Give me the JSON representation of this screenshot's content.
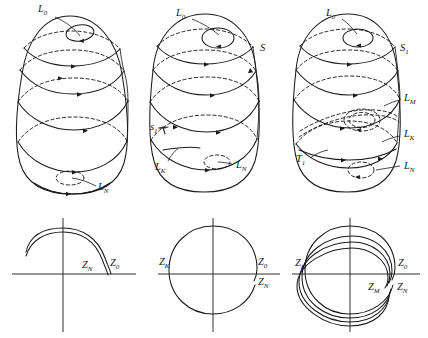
{
  "figure": {
    "caption": "",
    "panel_count": 6,
    "row_top_label": "surface diagrams",
    "row_bottom_label": "phase plane diagrams"
  },
  "panels": [
    {
      "id": "top-left",
      "kind": "surface",
      "labels": [
        {
          "name": "L-zero",
          "base": "L",
          "sub": "0",
          "x": 38,
          "y": 12
        },
        {
          "name": "L-N",
          "base": "L",
          "sub": "N",
          "x": 98,
          "y": 190
        }
      ]
    },
    {
      "id": "top-middle",
      "kind": "surface",
      "labels": [
        {
          "name": "L-zero",
          "base": "L",
          "sub": "0",
          "x": 176,
          "y": 16
        },
        {
          "name": "S",
          "base": "S",
          "sub": "",
          "x": 260,
          "y": 51
        },
        {
          "name": "s-one",
          "base": "s",
          "sub": "1",
          "x": 152,
          "y": 130
        },
        {
          "name": "L-K",
          "base": "L",
          "sub": "K",
          "x": 157,
          "y": 168
        },
        {
          "name": "L-N",
          "base": "L",
          "sub": "N",
          "x": 236,
          "y": 167
        }
      ]
    },
    {
      "id": "top-right",
      "kind": "surface",
      "labels": [
        {
          "name": "L-zero",
          "base": "L",
          "sub": "0",
          "x": 326,
          "y": 16
        },
        {
          "name": "S-one",
          "base": "S",
          "sub": "1",
          "x": 400,
          "y": 51
        },
        {
          "name": "L-M",
          "base": "L",
          "sub": "M",
          "x": 404,
          "y": 101
        },
        {
          "name": "L-K",
          "base": "L",
          "sub": "K",
          "x": 404,
          "y": 137
        },
        {
          "name": "T-one",
          "base": "T",
          "sub": "1",
          "x": 298,
          "y": 161
        },
        {
          "name": "L-N",
          "base": "L",
          "sub": "N",
          "x": 404,
          "y": 168
        }
      ]
    },
    {
      "id": "bottom-left",
      "kind": "phase",
      "curve": "open-arc",
      "labels": [
        {
          "name": "Z-N",
          "base": "Z",
          "sub": "N",
          "x": 82,
          "y": 268
        },
        {
          "name": "Z-zero",
          "base": "Z",
          "sub": "0",
          "x": 110,
          "y": 266
        }
      ]
    },
    {
      "id": "bottom-middle",
      "kind": "phase",
      "curve": "near-closed-circle",
      "labels": [
        {
          "name": "Z-K",
          "base": "Z",
          "sub": "K",
          "x": 160,
          "y": 264
        },
        {
          "name": "Z-zero",
          "base": "Z",
          "sub": "0",
          "x": 258,
          "y": 264
        },
        {
          "name": "Z-N",
          "base": "Z",
          "sub": "N",
          "x": 259,
          "y": 284
        }
      ]
    },
    {
      "id": "bottom-right",
      "kind": "phase",
      "curve": "multi-spiral",
      "labels": [
        {
          "name": "Z-K",
          "base": "Z",
          "sub": "K",
          "x": 296,
          "y": 265
        },
        {
          "name": "Z-zero",
          "base": "Z",
          "sub": "0",
          "x": 398,
          "y": 265
        },
        {
          "name": "Z-M",
          "base": "Z",
          "sub": "M",
          "x": 370,
          "y": 289
        },
        {
          "name": "Z-N",
          "base": "Z",
          "sub": "N",
          "x": 398,
          "y": 289
        }
      ]
    }
  ],
  "colors": {
    "ink": "#1a1a1a",
    "background": "#ffffff"
  }
}
